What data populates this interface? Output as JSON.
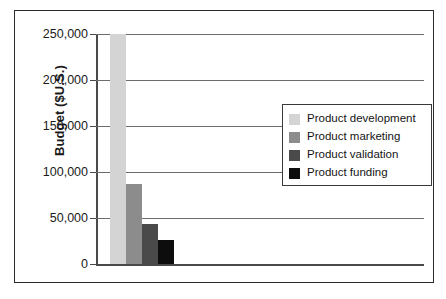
{
  "chart_data": {
    "type": "bar",
    "title": "",
    "xlabel": "",
    "ylabel": "Budget ($U.S.)",
    "ylim": [
      0,
      250000
    ],
    "yticks": [
      0,
      50000,
      100000,
      150000,
      200000,
      250000
    ],
    "ytick_labels": [
      "0",
      "50,000",
      "100,000",
      "150,000",
      "200,000",
      "250,000"
    ],
    "grid": true,
    "legend_position": "upper center",
    "categories": [
      "Product development",
      "Product marketing",
      "Product validation",
      "Product funding"
    ],
    "values": [
      250000,
      87000,
      43500,
      26000
    ],
    "colors": [
      "#d4d4d4",
      "#8c8c8c",
      "#4a4a4a",
      "#0d0d0d"
    ],
    "series": [
      {
        "name": "Budget",
        "values": [
          250000,
          87000,
          43500,
          26000
        ]
      }
    ]
  },
  "legend": {
    "items": [
      {
        "label": "Product development",
        "color": "#d4d4d4"
      },
      {
        "label": "Product marketing",
        "color": "#8c8c8c"
      },
      {
        "label": "Product validation",
        "color": "#4a4a4a"
      },
      {
        "label": "Product funding",
        "color": "#0d0d0d"
      }
    ]
  },
  "axis": {
    "y_title": "Budget ($U.S.)",
    "ticks": [
      {
        "label": "250,000",
        "value": 250000
      },
      {
        "label": "200,000",
        "value": 200000
      },
      {
        "label": "150,000",
        "value": 150000
      },
      {
        "label": "100,000",
        "value": 100000
      },
      {
        "label": "50,000",
        "value": 50000
      },
      {
        "label": "0",
        "value": 0
      }
    ]
  }
}
